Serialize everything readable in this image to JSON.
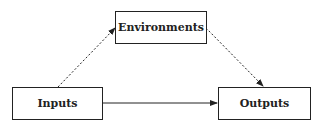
{
  "diagram": {
    "nodes": [
      {
        "id": "environments",
        "label": "Environments"
      },
      {
        "id": "inputs",
        "label": "Inputs"
      },
      {
        "id": "outputs",
        "label": "Outputs"
      }
    ],
    "edges": [
      {
        "from": "inputs",
        "to": "environments",
        "style": "dashed"
      },
      {
        "from": "environments",
        "to": "outputs",
        "style": "dashed"
      },
      {
        "from": "inputs",
        "to": "outputs",
        "style": "solid"
      }
    ]
  }
}
